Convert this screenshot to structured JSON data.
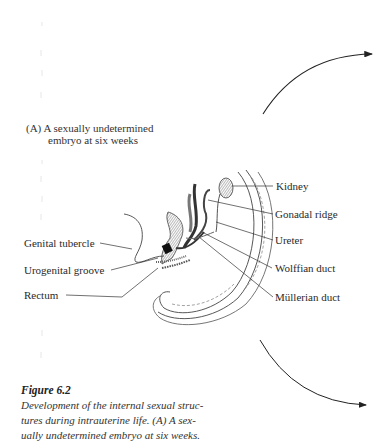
{
  "figure": {
    "panel_heading": {
      "marker": "(A)",
      "line1": "A sexually undetermined",
      "line2": "embryo at six weeks"
    },
    "labels_left": [
      {
        "id": "genital-tubercle",
        "text": "Genital tubercle"
      },
      {
        "id": "urogenital-groove",
        "text": "Urogenital groove"
      },
      {
        "id": "rectum",
        "text": "Rectum"
      }
    ],
    "labels_right": [
      {
        "id": "kidney",
        "text": "Kidney"
      },
      {
        "id": "gonadal-ridge",
        "text": "Gonadal ridge"
      },
      {
        "id": "ureter",
        "text": "Ureter"
      },
      {
        "id": "wolffian-duct",
        "text": "Wolffian duct"
      },
      {
        "id": "mullerian-duct",
        "text": "Müllerian duct"
      }
    ],
    "caption": {
      "title": "Figure 6.2",
      "lines": [
        "Development of the internal sexual struc-",
        "tures during intrauterine life. (A) A sex-",
        "ually undetermined embryo at six weeks."
      ]
    },
    "arrows": [
      {
        "id": "arrow-up-right",
        "direction": "up-right"
      },
      {
        "id": "arrow-down-right",
        "direction": "down-right"
      }
    ]
  }
}
